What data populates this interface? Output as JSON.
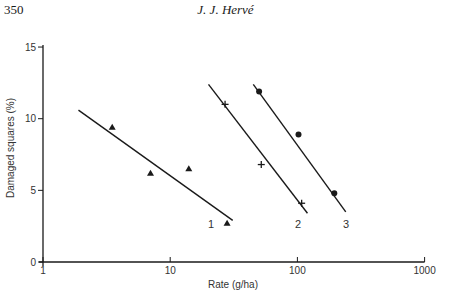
{
  "page": {
    "page_number": "350",
    "running_head": "J. J. Hervé"
  },
  "chart_data": {
    "type": "scatter",
    "title": "",
    "xlabel": "Rate (g/ha)",
    "ylabel": "Damaged squares (%)",
    "xscale": "log",
    "xlim": [
      1,
      1000
    ],
    "ylim": [
      0,
      15
    ],
    "x_ticks": [
      "1",
      "10",
      "100",
      "1000"
    ],
    "y_ticks": [
      "0",
      "5",
      "10",
      "15"
    ],
    "grid": false,
    "series": [
      {
        "name": "1",
        "marker": "triangle",
        "points": [
          [
            3.5,
            9.4
          ],
          [
            7.0,
            6.2
          ],
          [
            14,
            6.5
          ],
          [
            28,
            2.7
          ]
        ],
        "fit_line": [
          [
            1.9,
            10.6
          ],
          [
            31,
            2.9
          ]
        ]
      },
      {
        "name": "2",
        "marker": "plus",
        "points": [
          [
            27,
            11.0
          ],
          [
            52,
            6.8
          ],
          [
            108,
            4.1
          ]
        ],
        "fit_line": [
          [
            20,
            12.4
          ],
          [
            120,
            3.4
          ]
        ]
      },
      {
        "name": "3",
        "marker": "circle",
        "points": [
          [
            50,
            11.9
          ],
          [
            102,
            8.9
          ],
          [
            195,
            4.8
          ]
        ],
        "fit_line": [
          [
            45,
            12.4
          ],
          [
            240,
            3.5
          ]
        ]
      }
    ]
  }
}
